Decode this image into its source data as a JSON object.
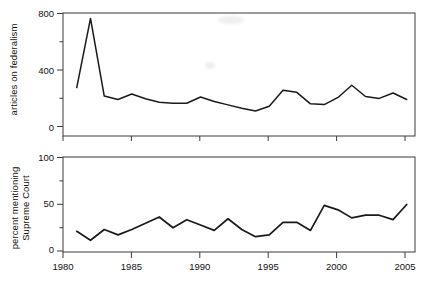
{
  "chart_data": [
    {
      "id": "articles-on-federalism",
      "type": "line",
      "title": "",
      "xlabel": "",
      "ylabel": "articles on federalism",
      "xlim": [
        1980,
        2005.6
      ],
      "ylim": [
        0,
        840
      ],
      "grid": false,
      "legend": "none",
      "xticks": [
        1980,
        1985,
        1990,
        1995,
        2000,
        2005
      ],
      "xticklabels": [
        "",
        "",
        "",
        "",
        "",
        ""
      ],
      "yticks": [
        0,
        200,
        400,
        600,
        800
      ],
      "yticklabels": [
        "0",
        "",
        "400",
        "",
        "800"
      ],
      "x": [
        1981,
        1982,
        1983,
        1984,
        1985,
        1986,
        1987,
        1988,
        1989,
        1990,
        1991,
        1992,
        1993,
        1994,
        1995,
        1996,
        1997,
        1998,
        1999,
        2000,
        2001,
        2002,
        2003,
        2004,
        2005
      ],
      "values": [
        288,
        800,
        225,
        200,
        240,
        205,
        180,
        172,
        172,
        218,
        185,
        160,
        135,
        115,
        150,
        268,
        253,
        168,
        162,
        215,
        305,
        222,
        208,
        248,
        200,
        288
      ]
    },
    {
      "id": "percent-mentioning-supreme-court",
      "type": "line",
      "title": "",
      "xlabel": "",
      "ylabel": "percent mentioning Supreme Court",
      "xlim": [
        1980,
        2005.6
      ],
      "ylim": [
        0,
        105
      ],
      "grid": false,
      "legend": "none",
      "xticks": [
        1980,
        1985,
        1990,
        1995,
        2000,
        2005
      ],
      "xticklabels": [
        "1980",
        "1985",
        "1990",
        "1995",
        "2000",
        "2005"
      ],
      "yticks": [
        0,
        25,
        50,
        75,
        100
      ],
      "yticklabels": [
        "0",
        "",
        "50",
        "",
        "100"
      ],
      "x": [
        1981,
        1982,
        1983,
        1984,
        1985,
        1986,
        1987,
        1988,
        1989,
        1990,
        1991,
        1992,
        1993,
        1994,
        1995,
        1996,
        1997,
        1998,
        1999,
        2000,
        2001,
        2002,
        2003,
        2004,
        2005
      ],
      "values": [
        22,
        12,
        24,
        18,
        24,
        31,
        38,
        26,
        35,
        29,
        23,
        36,
        24,
        16,
        18,
        32,
        32,
        23,
        51,
        46,
        37,
        40,
        40,
        35,
        52
      ]
    }
  ],
  "panels": {
    "top": {
      "ylabel": "articles on federalism",
      "ytick_labels": [
        "800",
        "400",
        "0"
      ]
    },
    "bottom": {
      "ylabel_line1": "percent mentioning",
      "ylabel_line2": "Supreme Court",
      "ytick_labels": [
        "100",
        "50",
        "0"
      ],
      "xtick_labels": [
        "1980",
        "1985",
        "1990",
        "1995",
        "2000",
        "2005"
      ]
    }
  },
  "style": {
    "line_color": "#1a1a1a",
    "axis_color": "#3a3a3a",
    "background": "#ffffff"
  }
}
